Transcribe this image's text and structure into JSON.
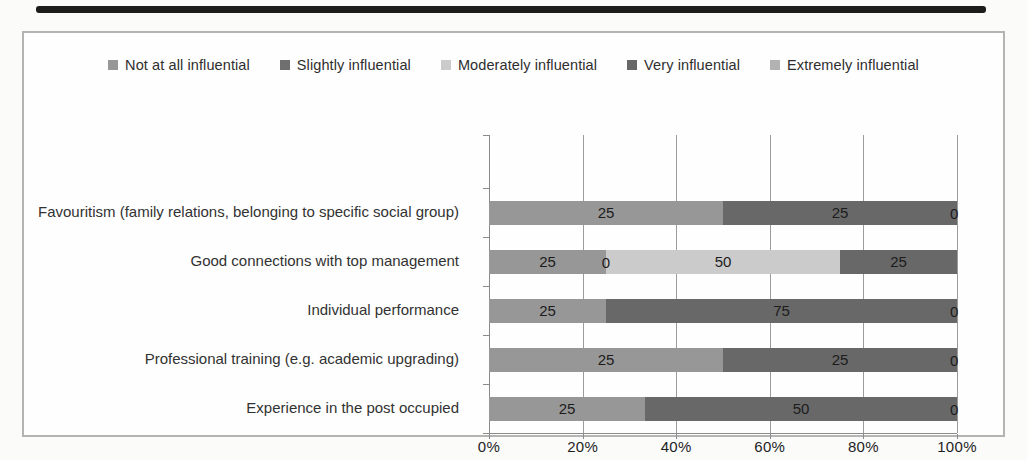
{
  "chart_data": {
    "type": "bar",
    "subtype": "stacked-100-percent",
    "orientation": "horizontal",
    "title": "",
    "xlabel": "",
    "ylabel": "",
    "legend_position": "top",
    "gridlines": "vertical",
    "categories": [
      "Favouritism (family relations, belonging to specific social group)",
      "Good connections with top management",
      "Individual performance",
      "Professional training (e.g. academic upgrading)",
      "Experience in the post occupied"
    ],
    "series": [
      {
        "name": "Not at all influential",
        "color": "#979797",
        "values": [
          25,
          25,
          25,
          25,
          25
        ]
      },
      {
        "name": "Slightly influential",
        "color": "#6f6f6f",
        "values": [
          null,
          0,
          null,
          null,
          null
        ]
      },
      {
        "name": "Moderately influential",
        "color": "#cbcbcb",
        "values": [
          null,
          50,
          null,
          null,
          null
        ]
      },
      {
        "name": "Very influential",
        "color": "#686868",
        "values": [
          25,
          25,
          75,
          25,
          50
        ]
      },
      {
        "name": "Extremely influential",
        "color": "#b2b2b2",
        "values": [
          0,
          null,
          0,
          0,
          0
        ]
      }
    ],
    "x_axis": {
      "ticks": [
        "0%",
        "20%",
        "40%",
        "60%",
        "80%",
        "100%"
      ],
      "range": [
        0,
        100
      ]
    },
    "colors": {
      "gridline": "#9b9b9b",
      "axis": "#8a8a8a",
      "label_text": "#1c1c1c"
    }
  }
}
